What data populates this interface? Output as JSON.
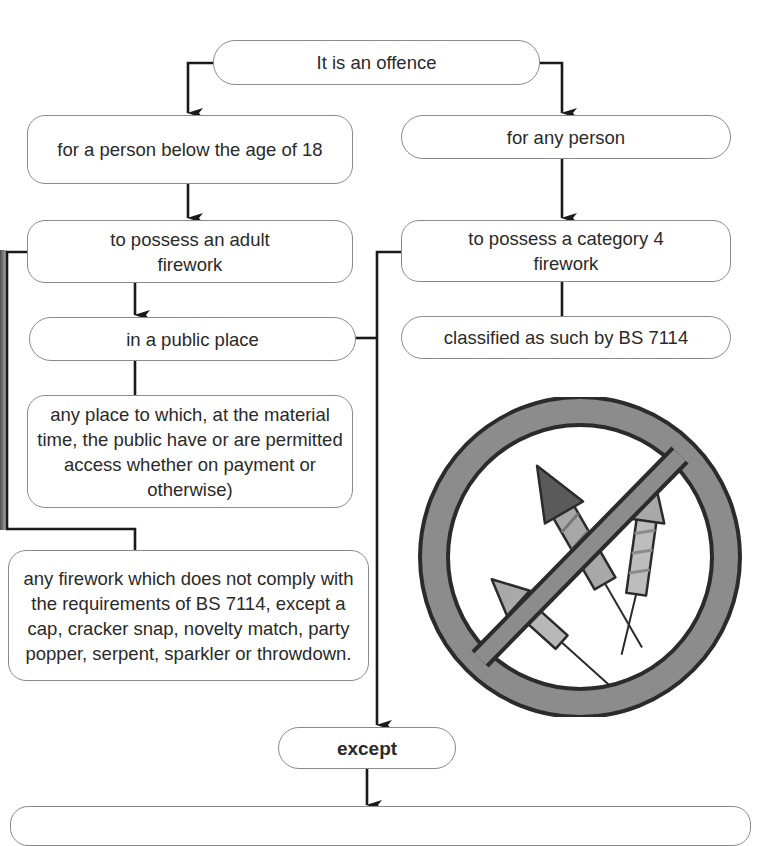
{
  "diagram": {
    "title": "It is an offence",
    "nodes": {
      "root": "It is an offence",
      "left_who": "for a person below the age of 18",
      "right_who": "for any person",
      "left_what": "to possess an adult firework",
      "right_what": "to possess a category 4 firework",
      "left_where": "in a public place",
      "right_classification": "classified as such by BS 7114",
      "public_place_definition": "any place to which, at the material time, the public have or are permitted access whether on payment or otherwise)",
      "adult_firework_definition": "any firework which does not comply with the requirements of BS 7114, except a cap, cracker snap, novelty match, party popper, serpent, sparkler or throwdown.",
      "exception": "except"
    },
    "edges": [
      {
        "from": "root",
        "to": "left_who",
        "arrow": true
      },
      {
        "from": "root",
        "to": "right_who",
        "arrow": true
      },
      {
        "from": "left_who",
        "to": "left_what",
        "arrow": true
      },
      {
        "from": "right_who",
        "to": "right_what",
        "arrow": true
      },
      {
        "from": "left_what",
        "to": "left_where",
        "arrow": true
      },
      {
        "from": "right_what",
        "to": "right_classification",
        "arrow": false
      },
      {
        "from": "left_where",
        "to": "public_place_definition",
        "arrow": false
      },
      {
        "from": "left_what",
        "to": "adult_firework_definition",
        "arrow": false
      },
      {
        "from": "left_where",
        "to": "exception",
        "arrow": true
      },
      {
        "from": "right_what",
        "to": "exception",
        "arrow": true
      },
      {
        "from": "exception",
        "to": "next_box",
        "arrow": true
      }
    ],
    "illustration": "no-fireworks-prohibition-sign",
    "colors": {
      "line": "#1a1a1a",
      "box_border": "#8a8a8a",
      "sign_ring": "#8c8c8c",
      "sign_outline": "#2b2b2b"
    }
  }
}
